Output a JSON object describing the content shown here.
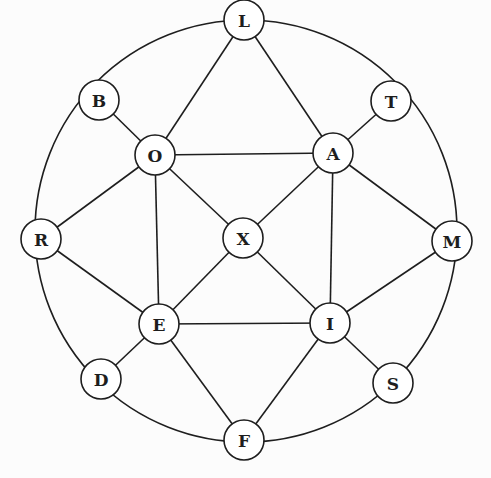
{
  "diagram": {
    "type": "graph",
    "outer_circle": {
      "cx": 246,
      "cy": 231,
      "r": 211
    },
    "node_radius": 20,
    "colors": {
      "stroke": "#1e1e1e",
      "node_fill": "#ffffff",
      "background": "#fcfcfc"
    },
    "nodes": [
      {
        "id": "L",
        "label": "L",
        "x": 244,
        "y": 20
      },
      {
        "id": "B",
        "label": "B",
        "x": 99,
        "y": 100
      },
      {
        "id": "T",
        "label": "T",
        "x": 391,
        "y": 101
      },
      {
        "id": "O",
        "label": "O",
        "x": 155,
        "y": 155
      },
      {
        "id": "A",
        "label": "A",
        "x": 333,
        "y": 153
      },
      {
        "id": "R",
        "label": "R",
        "x": 41,
        "y": 239
      },
      {
        "id": "X",
        "label": "X",
        "x": 243,
        "y": 238
      },
      {
        "id": "M",
        "label": "M",
        "x": 452,
        "y": 241
      },
      {
        "id": "E",
        "label": "E",
        "x": 159,
        "y": 324
      },
      {
        "id": "I",
        "label": "I",
        "x": 330,
        "y": 323
      },
      {
        "id": "D",
        "label": "D",
        "x": 101,
        "y": 379
      },
      {
        "id": "S",
        "label": "S",
        "x": 393,
        "y": 383
      },
      {
        "id": "F",
        "label": "F",
        "x": 244,
        "y": 440
      }
    ],
    "outer_arcs": [
      [
        "L",
        "T"
      ],
      [
        "T",
        "M"
      ],
      [
        "M",
        "S"
      ],
      [
        "S",
        "F"
      ],
      [
        "F",
        "D"
      ],
      [
        "D",
        "R"
      ],
      [
        "R",
        "B"
      ],
      [
        "B",
        "L"
      ]
    ],
    "edges": [
      [
        "L",
        "O"
      ],
      [
        "L",
        "A"
      ],
      [
        "B",
        "O"
      ],
      [
        "T",
        "A"
      ],
      [
        "O",
        "A"
      ],
      [
        "O",
        "R"
      ],
      [
        "O",
        "X"
      ],
      [
        "O",
        "E"
      ],
      [
        "A",
        "X"
      ],
      [
        "A",
        "M"
      ],
      [
        "A",
        "I"
      ],
      [
        "X",
        "E"
      ],
      [
        "X",
        "I"
      ],
      [
        "R",
        "E"
      ],
      [
        "M",
        "I"
      ],
      [
        "E",
        "I"
      ],
      [
        "E",
        "D"
      ],
      [
        "E",
        "F"
      ],
      [
        "I",
        "S"
      ],
      [
        "I",
        "F"
      ]
    ]
  }
}
